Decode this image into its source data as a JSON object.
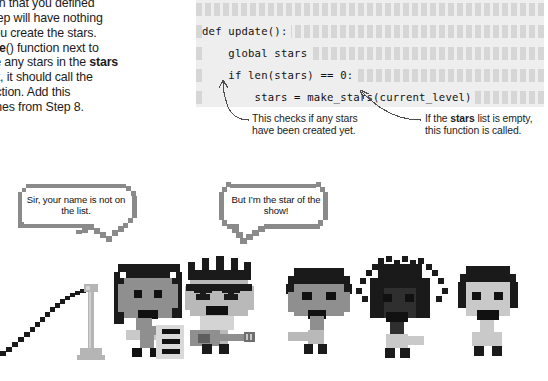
{
  "instructions": {
    "lines": [
      ") function that you defined",
      "vious step will have nothing",
      "nless you create the stars.",
      "e <b>update</b>() function next to",
      "here are any stars in the <b>stars</b>",
      "re aren’t, it should call the",
      "<b>rs</b>() function. Add this",
      "er the lines from Step 8."
    ]
  },
  "code": {
    "lines": [
      "def update():",
      "    global stars",
      "    if len(stars) == 0:",
      "        stars = make_stars(current_level)"
    ],
    "background_color": "#eeeeee",
    "hatch_color": "#d6d6d6",
    "text_color": "#111111"
  },
  "annotations": [
    {
      "id": "annot-left",
      "text_html": "This checks if any stars have been created yet."
    },
    {
      "id": "annot-right",
      "text_html": "If the <b>stars</b> list is empty, this function is called."
    }
  ],
  "speech_bubbles": [
    {
      "id": "bubble-bouncer",
      "text": "Sir, your name is not on the list."
    },
    {
      "id": "bubble-star",
      "text": "But I’m the star of the show!"
    }
  ],
  "characters": [
    {
      "name": "bouncer-with-clipboard"
    },
    {
      "name": "rock-star-with-guitar"
    },
    {
      "name": "fan-short-hair"
    },
    {
      "name": "fan-spiky-hair"
    },
    {
      "name": "fan-bob-hair"
    }
  ],
  "props": [
    {
      "name": "velvet-rope"
    },
    {
      "name": "stanchion-post"
    }
  ],
  "colors": {
    "ink": "#1c1c1c",
    "code_bg": "#eeeeee",
    "hatch": "#d6d6d6",
    "dark": "#1a1a1a",
    "mid_gray": "#8f8f8f",
    "light_gray": "#c9c9c9",
    "bubble_border": "#8a8a8a",
    "arrow": "#4d4d4d"
  }
}
